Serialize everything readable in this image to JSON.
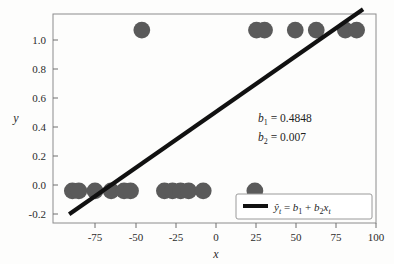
{
  "chart_data": {
    "type": "scatter",
    "title": "",
    "xlabel": "x",
    "ylabel": "y",
    "xlim": [
      -100,
      100
    ],
    "ylim": [
      -0.2,
      1.1
    ],
    "grid": false,
    "xticks": [
      "-75",
      "-50",
      "-25",
      "0",
      "25",
      "50",
      "75",
      "100"
    ],
    "xtick_values": [
      -75,
      -50,
      -25,
      0,
      25,
      50,
      75,
      100
    ],
    "yticks": [
      "1.0",
      "0.8",
      "0.6",
      "0.4",
      "0.2",
      "0.0",
      "-0.2"
    ],
    "ytick_values": [
      1.0,
      0.8,
      0.6,
      0.4,
      0.2,
      0.0,
      -0.2
    ],
    "marker_color": "#5a5a5a",
    "line_color": "#111111",
    "series": [
      {
        "name": "observations",
        "type": "scatter",
        "x": [
          -88,
          -84,
          -74,
          -64,
          -56,
          -52,
          -45,
          -31,
          -26,
          -21,
          -16,
          -7,
          25,
          26,
          31,
          50,
          63,
          81,
          88
        ],
        "y": [
          0,
          0,
          0,
          0,
          0,
          0,
          1,
          0,
          0,
          0,
          0,
          0,
          0,
          1,
          1,
          1,
          1,
          1,
          1
        ]
      },
      {
        "name": "fitted-line",
        "type": "line",
        "x": [
          -90,
          92
        ],
        "y": [
          -0.145,
          1.129
        ]
      }
    ],
    "annotations": [
      {
        "name": "b1",
        "symbol": "b",
        "subscript": "1",
        "equals": "=",
        "value": "0.4848"
      },
      {
        "name": "b2",
        "symbol": "b",
        "subscript": "2",
        "equals": "=",
        "value": "0.007"
      }
    ],
    "legend": {
      "position": "lower right",
      "entries": [
        {
          "name": "fitted-line",
          "label": "ŷₜ = b₁ + b₂xₜ",
          "parts": {
            "yhat": "ŷ",
            "sub_t1": "t",
            "eq": "=",
            "b": "b",
            "sub_1": "1",
            "plus": "+",
            "b2": "b",
            "sub_2": "2",
            "x": "x",
            "sub_t2": "t"
          }
        }
      ]
    }
  },
  "axes": {
    "xlabel": "x",
    "ylabel": "y"
  }
}
